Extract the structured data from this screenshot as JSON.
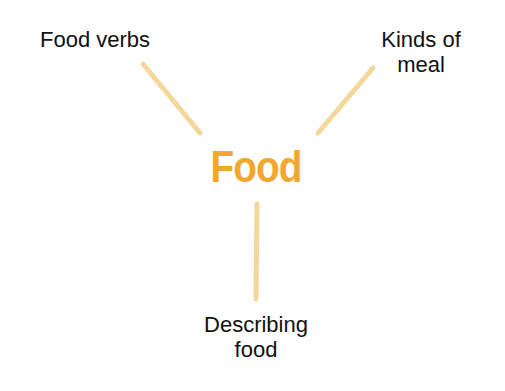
{
  "diagram": {
    "type": "mind-map",
    "center": {
      "label": "Food",
      "color": "#f2a72f"
    },
    "branches": [
      {
        "label_lines": [
          "Food verbs"
        ]
      },
      {
        "label_lines": [
          "Kinds of",
          "meal"
        ]
      },
      {
        "label_lines": [
          "Describing",
          "food"
        ]
      }
    ],
    "connector_color": "#f5d79a"
  }
}
